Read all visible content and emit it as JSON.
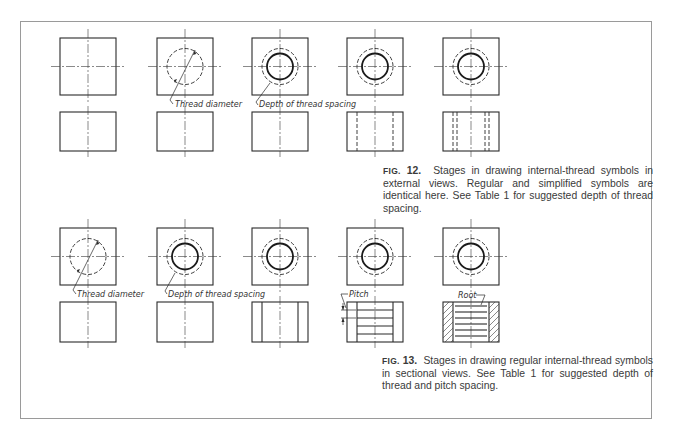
{
  "figures": [
    {
      "id": "fig12",
      "caption": {
        "label": "FIG.",
        "number": "12.",
        "text": "Stages in drawing internal-thread symbols in external views. Regular and simplified symbols are identical here. See Table 1 for suggested depth of thread spacing."
      },
      "stages": 5,
      "annotations": [
        "Thread diameter",
        "Depth of thread spacing"
      ]
    },
    {
      "id": "fig13",
      "caption": {
        "label": "FIG.",
        "number": "13.",
        "text": "Stages in drawing regular internal-thread symbols in sectional views. See Table 1 for suggested depth of thread and pitch spacing."
      },
      "stages": 5,
      "annotations": [
        "Thread diameter",
        "Depth of thread spacing",
        "Pitch",
        "Root"
      ]
    }
  ],
  "labels": {
    "thread_diameter": "Thread diameter",
    "depth_of_thread_spacing": "Depth of thread spacing",
    "pitch": "Pitch",
    "root": "Root"
  },
  "colors": {
    "line": "#2a2a2a",
    "frame": "#9a9a9a",
    "text": "#3a3a3a"
  }
}
